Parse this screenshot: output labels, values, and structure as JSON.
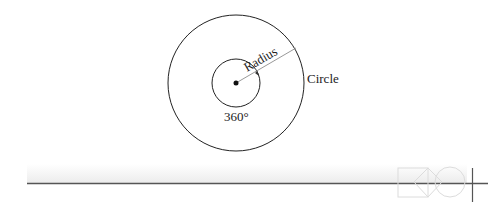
{
  "diagram": {
    "labels": {
      "radius": "Radius",
      "circle": "Circle",
      "angle": "360°"
    },
    "geometry": {
      "center": [
        236,
        83
      ],
      "outer_radius": 68,
      "inner_radius": 24
    },
    "colors": {
      "stroke": "#222222",
      "radius_line": "#888888",
      "band_light": "#f4f4f4",
      "rule": "#555555",
      "logo": "#dddddd"
    }
  },
  "footer": {
    "logo_icon": "square-diamond-circle-logo"
  }
}
